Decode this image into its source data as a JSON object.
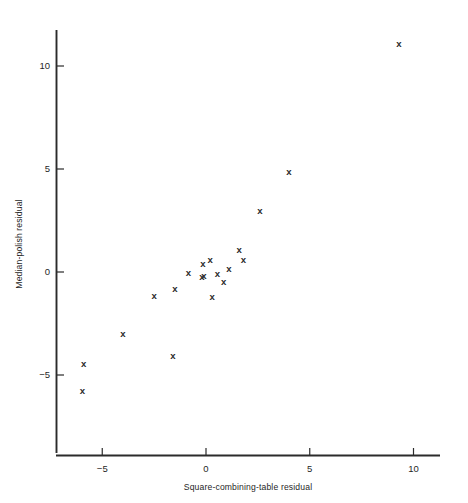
{
  "chart_data": {
    "type": "scatter",
    "title": "",
    "subtitle": "",
    "xlabel": "Square-combining-table residual",
    "ylabel": "Median-polish residual",
    "xlim": [
      -6.9,
      11.3
    ],
    "ylim": [
      -6.9,
      12.1
    ],
    "xticks": [
      -5,
      0,
      5,
      10
    ],
    "xticklabels": [
      "−5",
      "0",
      "5",
      "10"
    ],
    "yticks": [
      -5,
      0,
      5,
      10
    ],
    "yticklabels": [
      "−5",
      "0",
      "5",
      "10"
    ],
    "grid": false,
    "legend": null,
    "marker": "x",
    "marker_color": "#2a2a2a",
    "points": [
      {
        "x": 9.3,
        "y": 11.1
      },
      {
        "x": 4.0,
        "y": 4.9
      },
      {
        "x": 2.6,
        "y": 3.0
      },
      {
        "x": 1.6,
        "y": 1.1
      },
      {
        "x": 1.8,
        "y": 0.6
      },
      {
        "x": 0.2,
        "y": 0.6
      },
      {
        "x": -0.15,
        "y": 0.4
      },
      {
        "x": 1.1,
        "y": 0.15
      },
      {
        "x": -0.85,
        "y": 0.0
      },
      {
        "x": 0.55,
        "y": -0.05
      },
      {
        "x": -0.1,
        "y": -0.15
      },
      {
        "x": -0.2,
        "y": -0.2
      },
      {
        "x": 0.85,
        "y": -0.45
      },
      {
        "x": -1.5,
        "y": -0.8
      },
      {
        "x": 0.3,
        "y": -1.2
      },
      {
        "x": -2.5,
        "y": -1.15
      },
      {
        "x": -1.6,
        "y": -4.05
      },
      {
        "x": -4.0,
        "y": -3.0
      },
      {
        "x": -5.9,
        "y": -4.45
      },
      {
        "x": -5.95,
        "y": -5.75
      }
    ]
  },
  "axes": {
    "x_axis_name": "x-axis",
    "y_axis_name": "y-axis"
  }
}
